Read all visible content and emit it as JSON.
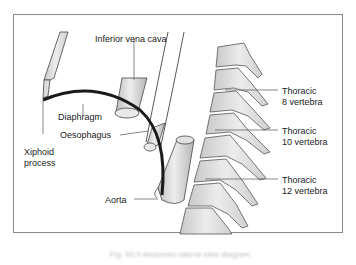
{
  "figure": {
    "labels": {
      "ivc": "Inferior vena cava",
      "diaphragm": "Diaphragm",
      "oesophagus": "Oesophagus",
      "xiphoid_line1": "Xiphoid",
      "xiphoid_line2": "process",
      "aorta": "Aorta",
      "t8_line1": "Thoracic",
      "t8_line2": "8 vertebra",
      "t10_line1": "Thoracic",
      "t10_line2": "10 vertebra",
      "t12_line1": "Thoracic",
      "t12_line2": "12 vertebra"
    },
    "caption": "Fig. 00.0 Abdomen lateral view diagram",
    "colors": {
      "frame": "#8a8a8a",
      "outline": "#444444",
      "diaphragm": "#1a1a1a",
      "bone_fill": "#d9d9d9",
      "vessel_fill": "#cfcfcf"
    }
  }
}
